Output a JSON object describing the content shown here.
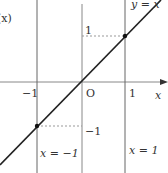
{
  "diagram": {
    "title_fragment": "(x)",
    "axes": {
      "x_label": "x",
      "origin_label": "O"
    },
    "ticks": {
      "x_neg_one": "−1",
      "x_one": "1",
      "y_one": "1",
      "y_neg_one": "−1"
    },
    "lines": {
      "diagonal": "y = x",
      "vertical_left": "x = −1",
      "vertical_right": "x = 1"
    },
    "points": [
      {
        "x": 1,
        "y": 1
      },
      {
        "x": -1,
        "y": -1
      }
    ],
    "colors": {
      "axis": "#888888",
      "line": "#222222",
      "dotted": "#999999",
      "text": "#333333"
    }
  }
}
